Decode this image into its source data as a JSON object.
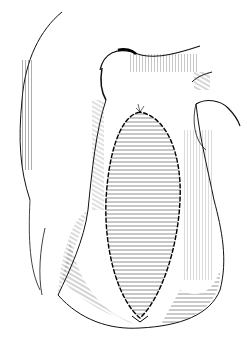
{
  "image": {
    "subject": "line drawing of heart with sutured elliptical patch",
    "background": "#ffffff",
    "ink": "#111111"
  }
}
